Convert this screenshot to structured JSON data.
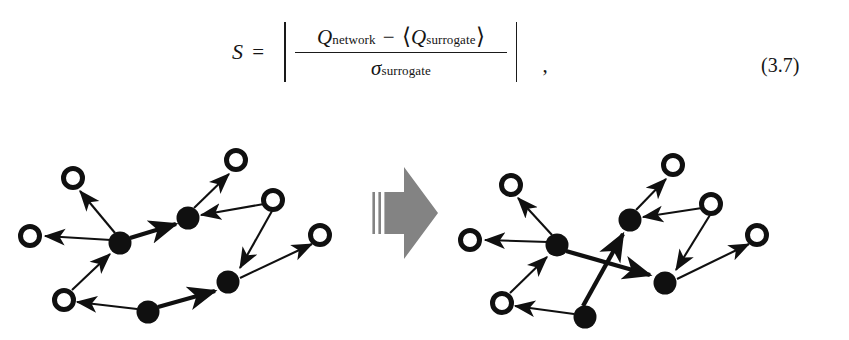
{
  "equation": {
    "lhs": "S",
    "relation": "=",
    "numerator": {
      "first_symbol": "Q",
      "first_superscript": "network",
      "operator": "−",
      "bracket_open": "⟨",
      "second_symbol": "Q",
      "second_superscript": "surrogate",
      "bracket_close": "⟩"
    },
    "denominator": {
      "symbol": "σ",
      "subscript": "surrogate"
    },
    "absolute_value_bar": "|",
    "trailing_punctuation": ",",
    "number": "(3.7)"
  },
  "figure": {
    "caption": "",
    "transform_arrow": {
      "name": "thick-block-arrow",
      "direction": "right",
      "color": "#808080",
      "stripe_count": 3
    },
    "colors": {
      "node_filled": "#101010",
      "node_open_stroke": "#101010",
      "node_open_fill": "#ffffff",
      "edge": "#101010",
      "background": "#ffffff"
    },
    "left_network": {
      "label": "original network",
      "nodes": [
        {
          "id": "L1",
          "type": "open",
          "x": 30,
          "y": 118,
          "r": 9.5
        },
        {
          "id": "L2",
          "type": "open",
          "x": 73,
          "y": 60,
          "r": 9.5
        },
        {
          "id": "L3",
          "type": "filled",
          "x": 120,
          "y": 125,
          "r": 11.5
        },
        {
          "id": "L4",
          "type": "filled",
          "x": 188,
          "y": 100,
          "r": 11.5
        },
        {
          "id": "L5",
          "type": "open",
          "x": 236,
          "y": 42,
          "r": 9.5
        },
        {
          "id": "L6",
          "type": "open",
          "x": 273,
          "y": 82,
          "r": 9.5
        },
        {
          "id": "L7",
          "type": "filled",
          "x": 228,
          "y": 164,
          "r": 11.5
        },
        {
          "id": "L8",
          "type": "open",
          "x": 320,
          "y": 117,
          "r": 9.5
        },
        {
          "id": "L9",
          "type": "open",
          "x": 64,
          "y": 182,
          "r": 9.5
        },
        {
          "id": "L10",
          "type": "filled",
          "x": 148,
          "y": 194,
          "r": 11.5
        }
      ],
      "edges": [
        {
          "from": "L3",
          "to": "L1",
          "weight": "thin"
        },
        {
          "from": "L3",
          "to": "L2",
          "weight": "thin"
        },
        {
          "from": "L3",
          "to": "L4",
          "weight": "thick"
        },
        {
          "from": "L4",
          "to": "L5",
          "weight": "thin"
        },
        {
          "from": "L6",
          "to": "L4",
          "weight": "thin"
        },
        {
          "from": "L6",
          "to": "L7",
          "weight": "thin"
        },
        {
          "from": "L9",
          "to": "L3",
          "weight": "thin"
        },
        {
          "from": "L10",
          "to": "L9",
          "weight": "thin"
        },
        {
          "from": "L10",
          "to": "L7",
          "weight": "thick"
        },
        {
          "from": "L7",
          "to": "L8",
          "weight": "thin"
        }
      ]
    },
    "right_network": {
      "label": "surrogate network",
      "nodes": [
        {
          "id": "R1",
          "type": "open",
          "x": 470,
          "y": 122,
          "r": 9.5
        },
        {
          "id": "R2",
          "type": "open",
          "x": 511,
          "y": 67,
          "r": 9.5
        },
        {
          "id": "R3",
          "type": "filled",
          "x": 557,
          "y": 127,
          "r": 11.5
        },
        {
          "id": "R4",
          "type": "filled",
          "x": 630,
          "y": 102,
          "r": 11.5
        },
        {
          "id": "R5",
          "type": "open",
          "x": 673,
          "y": 47,
          "r": 9.5
        },
        {
          "id": "R6",
          "type": "open",
          "x": 711,
          "y": 86,
          "r": 9.5
        },
        {
          "id": "R7",
          "type": "filled",
          "x": 665,
          "y": 165,
          "r": 11.5
        },
        {
          "id": "R8",
          "type": "open",
          "x": 757,
          "y": 117,
          "r": 9.5
        },
        {
          "id": "R9",
          "type": "open",
          "x": 502,
          "y": 185,
          "r": 9.5
        },
        {
          "id": "R10",
          "type": "filled",
          "x": 585,
          "y": 199,
          "r": 11.5
        }
      ],
      "edges": [
        {
          "from": "R3",
          "to": "R1",
          "weight": "thin"
        },
        {
          "from": "R3",
          "to": "R2",
          "weight": "thin"
        },
        {
          "from": "R3",
          "to": "R7",
          "weight": "thick"
        },
        {
          "from": "R4",
          "to": "R5",
          "weight": "thin"
        },
        {
          "from": "R6",
          "to": "R4",
          "weight": "thin"
        },
        {
          "from": "R6",
          "to": "R7",
          "weight": "thin"
        },
        {
          "from": "R9",
          "to": "R3",
          "weight": "thin"
        },
        {
          "from": "R10",
          "to": "R9",
          "weight": "thin"
        },
        {
          "from": "R10",
          "to": "R4",
          "weight": "thick"
        },
        {
          "from": "R7",
          "to": "R8",
          "weight": "thin"
        }
      ]
    }
  }
}
